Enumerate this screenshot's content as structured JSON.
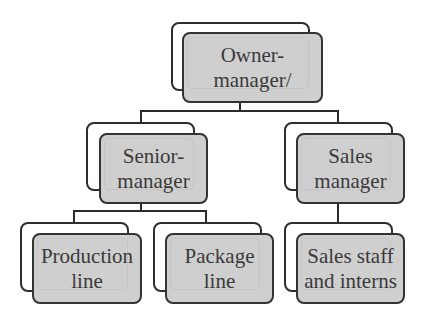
{
  "diagram": {
    "type": "org-chart",
    "nodes": [
      {
        "id": "owner",
        "label": "Owner-\nmanager/"
      },
      {
        "id": "senior",
        "label": "Senior-\nmanager",
        "parent": "owner"
      },
      {
        "id": "sales_manager",
        "label": "Sales\nmanager",
        "parent": "owner"
      },
      {
        "id": "production",
        "label": "Production\nline",
        "parent": "senior"
      },
      {
        "id": "package",
        "label": "Package\nline",
        "parent": "senior"
      },
      {
        "id": "sales_staff",
        "label": "Sales staff\nand interns",
        "parent": "sales_manager"
      }
    ],
    "colors": {
      "box_fill": "#cfcfcf",
      "box_border": "#333333",
      "text": "#3a3a3a",
      "connector": "#2b2b2b"
    }
  }
}
